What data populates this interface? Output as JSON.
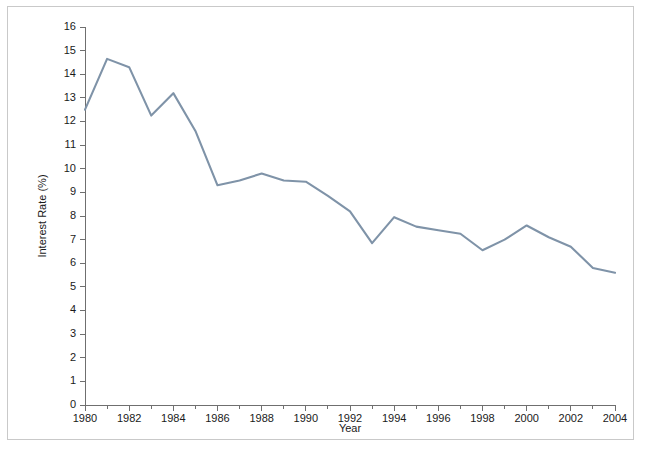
{
  "figure": {
    "border_color": "#c9c9c9",
    "background": "#ffffff"
  },
  "chart_data": {
    "type": "line",
    "title": "",
    "xlabel": "Year",
    "ylabel": "Interest Rate (%)",
    "xlim": [
      1980,
      2004
    ],
    "ylim": [
      0,
      16
    ],
    "grid": false,
    "legend": null,
    "line_color": "#7f93a8",
    "x": [
      1980,
      1981,
      1982,
      1983,
      1984,
      1985,
      1986,
      1987,
      1988,
      1989,
      1990,
      1991,
      1992,
      1993,
      1994,
      1995,
      1996,
      1997,
      1998,
      1999,
      2000,
      2001,
      2002,
      2003,
      2004
    ],
    "values": [
      12.5,
      14.65,
      14.3,
      12.25,
      13.2,
      11.6,
      9.3,
      9.5,
      9.8,
      9.5,
      9.45,
      8.85,
      8.2,
      6.85,
      7.95,
      7.55,
      7.4,
      7.25,
      6.55,
      7.0,
      7.6,
      7.1,
      6.7,
      5.8,
      5.6
    ],
    "y_tick_labels": [
      "0",
      "1",
      "2",
      "3",
      "4",
      "5",
      "6",
      "7",
      "8",
      "9",
      "10",
      "11",
      "12",
      "13",
      "14",
      "15",
      "16"
    ],
    "y_tick_values": [
      0,
      1,
      2,
      3,
      4,
      5,
      6,
      7,
      8,
      9,
      10,
      11,
      12,
      13,
      14,
      15,
      16
    ],
    "x_major_tick_labels": [
      "1980",
      "1982",
      "1984",
      "1986",
      "1988",
      "1990",
      "1992",
      "1994",
      "1996",
      "1998",
      "2000",
      "2002",
      "2004"
    ],
    "x_major_tick_values": [
      1980,
      1982,
      1984,
      1986,
      1988,
      1990,
      1992,
      1994,
      1996,
      1998,
      2000,
      2002,
      2004
    ],
    "x_minor_tick_values": [
      1981,
      1983,
      1985,
      1987,
      1989,
      1991,
      1993,
      1995,
      1997,
      1999,
      2001,
      2003
    ]
  }
}
